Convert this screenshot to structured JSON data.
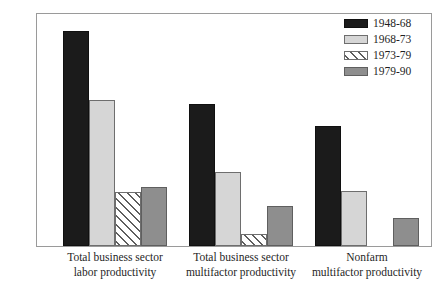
{
  "chart_data": {
    "type": "bar",
    "title": "",
    "subtitle": "",
    "xlabel": "",
    "ylabel": "",
    "ylim": [
      0,
      3.5
    ],
    "ytick_labels": [
      "0",
      "0.5",
      "1.0",
      "1.5",
      "2.0",
      "2.5",
      "3.0",
      "3.5"
    ],
    "ytick_values": [
      0,
      0.5,
      1.0,
      1.5,
      2.0,
      2.5,
      3.0,
      3.5
    ],
    "grid": false,
    "legend_position": "top-right",
    "categories": [
      "Total business sector labor productivity",
      "Total business sector multifactor productivity",
      "Nonfarm multifactor productivity"
    ],
    "category_lines": [
      [
        "Total business sector",
        "labor productivity"
      ],
      [
        "Total business sector",
        "multifactor productivity"
      ],
      [
        "Nonfarm",
        "multifactor productivity"
      ]
    ],
    "series": [
      {
        "name": "1948-68",
        "color": "#1b1b1b",
        "fill": "solid-black",
        "values": [
          3.25,
          2.15,
          1.81
        ]
      },
      {
        "name": "1968-73",
        "color": "#d6d6d6",
        "fill": "light-gray",
        "values": [
          2.21,
          1.11,
          0.83
        ]
      },
      {
        "name": "1973-79",
        "color": "#ffffff",
        "fill": "diagonal-hatch",
        "values": [
          0.82,
          0.18,
          0.0
        ]
      },
      {
        "name": "1979-90",
        "color": "#8e8e8e",
        "fill": "medium-gray",
        "values": [
          0.89,
          0.6,
          0.43
        ]
      }
    ]
  }
}
